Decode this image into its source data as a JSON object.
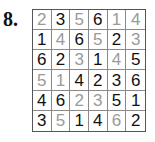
{
  "puzzle": {
    "label": "8.",
    "size": 6,
    "colors": {
      "given": "#111111",
      "filled": "#9a9a9a",
      "border": "#555555"
    },
    "rows": [
      [
        {
          "v": "2",
          "t": "filled"
        },
        {
          "v": "3",
          "t": "given"
        },
        {
          "v": "5",
          "t": "filled"
        },
        {
          "v": "6",
          "t": "given"
        },
        {
          "v": "1",
          "t": "filled"
        },
        {
          "v": "4",
          "t": "filled"
        }
      ],
      [
        {
          "v": "1",
          "t": "given"
        },
        {
          "v": "4",
          "t": "filled"
        },
        {
          "v": "6",
          "t": "given"
        },
        {
          "v": "5",
          "t": "filled"
        },
        {
          "v": "2",
          "t": "given"
        },
        {
          "v": "3",
          "t": "filled"
        }
      ],
      [
        {
          "v": "6",
          "t": "given"
        },
        {
          "v": "2",
          "t": "given"
        },
        {
          "v": "3",
          "t": "filled"
        },
        {
          "v": "1",
          "t": "given"
        },
        {
          "v": "4",
          "t": "filled"
        },
        {
          "v": "5",
          "t": "given"
        }
      ],
      [
        {
          "v": "5",
          "t": "filled"
        },
        {
          "v": "1",
          "t": "filled"
        },
        {
          "v": "4",
          "t": "given"
        },
        {
          "v": "2",
          "t": "given"
        },
        {
          "v": "3",
          "t": "given"
        },
        {
          "v": "6",
          "t": "given"
        }
      ],
      [
        {
          "v": "4",
          "t": "given"
        },
        {
          "v": "6",
          "t": "given"
        },
        {
          "v": "2",
          "t": "filled"
        },
        {
          "v": "3",
          "t": "filled"
        },
        {
          "v": "5",
          "t": "given"
        },
        {
          "v": "1",
          "t": "given"
        }
      ],
      [
        {
          "v": "3",
          "t": "given"
        },
        {
          "v": "5",
          "t": "filled"
        },
        {
          "v": "1",
          "t": "given"
        },
        {
          "v": "4",
          "t": "given"
        },
        {
          "v": "6",
          "t": "filled"
        },
        {
          "v": "2",
          "t": "given"
        }
      ]
    ]
  }
}
